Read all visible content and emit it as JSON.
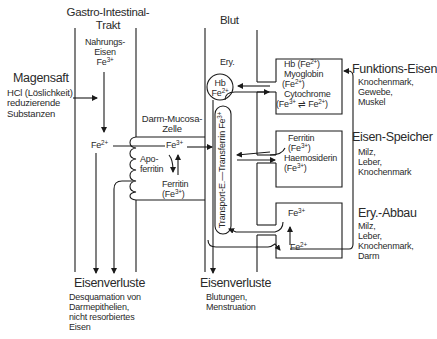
{
  "columns": {
    "gi": {
      "title_line1": "Gastro-Intestinal-",
      "title_line2": "Trakt"
    },
    "blood": {
      "title": "Blut"
    }
  },
  "magensaft": {
    "title": "Magensaft",
    "lines": [
      "HCl (Löslichkeit)",
      "reduzierende",
      "Substanzen"
    ]
  },
  "nahrung": {
    "line1": "Nahrungs-",
    "line2": "Eisen",
    "ion": "Fe",
    "charge": "3+"
  },
  "mucosa": {
    "label_line1": "Darm-Mucosa-",
    "label_line2": "Zelle",
    "fe2_ion": "Fe",
    "fe2_charge": "2+",
    "fe3_ion": "Fe",
    "fe3_charge": "3+",
    "apoferritin_line1": "Apo-",
    "apoferritin_line2": "ferritin",
    "ferritin_line1": "Ferritin",
    "ferritin_line2_prefix": "(Fe",
    "ferritin_line2_charge": "3+",
    "ferritin_line2_suffix": ")"
  },
  "blood": {
    "ery_label": "Ery.",
    "hb_line1": "Hb",
    "hb_line2_ion": "Fe",
    "hb_line2_charge": "2+",
    "transport_label": "Transport-E.—Transferrin Fe",
    "transport_charge": "3+"
  },
  "boxes": {
    "funktion": {
      "line1_prefix": "Hb (Fe",
      "line1_charge": "2+",
      "line1_suffix": ")",
      "line2": "Myoglobin",
      "line3_prefix": "(Fe",
      "line3_charge": "2+",
      "line3_suffix": ")",
      "line4": "Cytochrome",
      "line5_a": "(Fe",
      "line5_a_charge": "3+",
      "line5_arrow": "⇌",
      "line5_b": "Fe",
      "line5_b_charge": "2+",
      "line5_suffix": ")"
    },
    "speicher": {
      "line1": "Ferritin",
      "line2_prefix": "(Fe",
      "line2_charge": "3+",
      "line2_suffix": ")",
      "line3": "Haemosiderin",
      "line4_prefix": "(Fe",
      "line4_charge": "3+",
      "line4_suffix": ")"
    },
    "abbau": {
      "fe3_ion": "Fe",
      "fe3_charge": "3+",
      "fe2_ion": "Fe",
      "fe2_charge": "2+"
    }
  },
  "right_labels": {
    "funktion": {
      "title": "Funktions-Eisen",
      "lines": [
        "Knochenmark,",
        "Gewebe,",
        "Muskel"
      ]
    },
    "speicher": {
      "title": "Eisen-Speicher",
      "lines": [
        "Milz,",
        "Leber,",
        "Knochenmark"
      ]
    },
    "abbau": {
      "title": "Ery.-Abbau",
      "lines": [
        "Milz,",
        "Leber,",
        "Knochenmark,",
        "Darm"
      ]
    }
  },
  "losses": {
    "gi": {
      "title": "Eisenverluste",
      "lines": [
        "Desquamation von",
        "Darmepithelien,",
        "nicht resorbiertes",
        "Eisen"
      ]
    },
    "blood": {
      "title": "Eisenverluste",
      "lines": [
        "Blutungen,",
        "Menstruation"
      ]
    }
  },
  "colors": {
    "line": "#1a1a1a",
    "text": "#2a2a2a",
    "background": "#ffffff"
  }
}
